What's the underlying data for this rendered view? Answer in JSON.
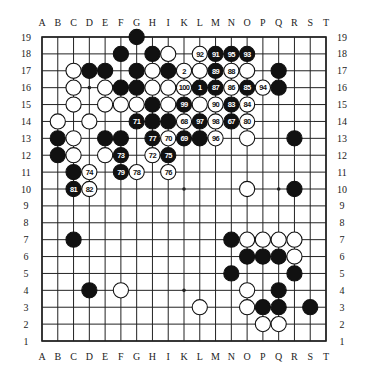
{
  "diagram": {
    "type": "go-board",
    "size": 19,
    "column_labels": [
      "A",
      "B",
      "C",
      "D",
      "E",
      "F",
      "G",
      "H",
      "J",
      "K",
      "L",
      "M",
      "N",
      "O",
      "P",
      "Q",
      "R",
      "S",
      "T"
    ],
    "column_labels_display": [
      "A",
      "B",
      "C",
      "D",
      "E",
      "F",
      "G",
      "H",
      "I",
      "K",
      "L",
      "M",
      "N",
      "O",
      "P",
      "Q",
      "R",
      "S",
      "T"
    ],
    "row_labels": [
      "19",
      "18",
      "17",
      "16",
      "15",
      "14",
      "13",
      "12",
      "11",
      "10",
      "9",
      "8",
      "7",
      "6",
      "5",
      "4",
      "3",
      "2",
      "1"
    ],
    "star_points": [
      "D16",
      "K10",
      "D4",
      "K4",
      "Q4",
      "D10",
      "Q10",
      "K16",
      "Q16"
    ],
    "colors": {
      "black": "#111111",
      "white": "#ffffff",
      "line": "#222222",
      "background": "#ffffff"
    },
    "stones": [
      {
        "pos": "G19",
        "color": "black",
        "label": ""
      },
      {
        "pos": "F18",
        "color": "black",
        "label": ""
      },
      {
        "pos": "H18",
        "color": "black",
        "label": ""
      },
      {
        "pos": "J18",
        "color": "white",
        "label": ""
      },
      {
        "pos": "L18",
        "color": "white",
        "label": "92"
      },
      {
        "pos": "M18",
        "color": "black",
        "label": "91"
      },
      {
        "pos": "N18",
        "color": "black",
        "label": "95"
      },
      {
        "pos": "O18",
        "color": "black",
        "label": "93"
      },
      {
        "pos": "C17",
        "color": "white",
        "label": ""
      },
      {
        "pos": "D17",
        "color": "black",
        "label": ""
      },
      {
        "pos": "E17",
        "color": "black",
        "label": ""
      },
      {
        "pos": "G17",
        "color": "black",
        "label": ""
      },
      {
        "pos": "H17",
        "color": "white",
        "label": ""
      },
      {
        "pos": "J17",
        "color": "black",
        "label": ""
      },
      {
        "pos": "K17",
        "color": "white",
        "label": "2"
      },
      {
        "pos": "L17",
        "color": "white",
        "label": ""
      },
      {
        "pos": "M17",
        "color": "black",
        "label": "89"
      },
      {
        "pos": "N17",
        "color": "white",
        "label": "88"
      },
      {
        "pos": "O17",
        "color": "white",
        "label": ""
      },
      {
        "pos": "Q17",
        "color": "black",
        "label": ""
      },
      {
        "pos": "C16",
        "color": "white",
        "label": ""
      },
      {
        "pos": "E16",
        "color": "white",
        "label": ""
      },
      {
        "pos": "F16",
        "color": "black",
        "label": ""
      },
      {
        "pos": "G16",
        "color": "black",
        "label": ""
      },
      {
        "pos": "H16",
        "color": "white",
        "label": ""
      },
      {
        "pos": "J16",
        "color": "white",
        "label": ""
      },
      {
        "pos": "K16",
        "color": "white",
        "label": "100"
      },
      {
        "pos": "L16",
        "color": "black",
        "label": "1"
      },
      {
        "pos": "M16",
        "color": "black",
        "label": "87"
      },
      {
        "pos": "N16",
        "color": "white",
        "label": "86"
      },
      {
        "pos": "O16",
        "color": "black",
        "label": "85"
      },
      {
        "pos": "P16",
        "color": "white",
        "label": "94"
      },
      {
        "pos": "Q16",
        "color": "black",
        "label": ""
      },
      {
        "pos": "C15",
        "color": "white",
        "label": ""
      },
      {
        "pos": "E15",
        "color": "white",
        "label": ""
      },
      {
        "pos": "F15",
        "color": "white",
        "label": ""
      },
      {
        "pos": "G15",
        "color": "white",
        "label": ""
      },
      {
        "pos": "H15",
        "color": "black",
        "label": ""
      },
      {
        "pos": "J15",
        "color": "white",
        "label": ""
      },
      {
        "pos": "K15",
        "color": "black",
        "label": "99"
      },
      {
        "pos": "L15",
        "color": "white",
        "label": ""
      },
      {
        "pos": "M15",
        "color": "white",
        "label": "90"
      },
      {
        "pos": "N15",
        "color": "black",
        "label": "83"
      },
      {
        "pos": "O15",
        "color": "white",
        "label": "84"
      },
      {
        "pos": "B14",
        "color": "white",
        "label": ""
      },
      {
        "pos": "D14",
        "color": "white",
        "label": ""
      },
      {
        "pos": "G14",
        "color": "black",
        "label": "71"
      },
      {
        "pos": "H14",
        "color": "black",
        "label": ""
      },
      {
        "pos": "J14",
        "color": "black",
        "label": ""
      },
      {
        "pos": "K14",
        "color": "white",
        "label": "68"
      },
      {
        "pos": "L14",
        "color": "black",
        "label": "97"
      },
      {
        "pos": "M14",
        "color": "white",
        "label": "98"
      },
      {
        "pos": "N14",
        "color": "black",
        "label": "67"
      },
      {
        "pos": "O14",
        "color": "white",
        "label": "80"
      },
      {
        "pos": "B13",
        "color": "black",
        "label": ""
      },
      {
        "pos": "C13",
        "color": "white",
        "label": ""
      },
      {
        "pos": "E13",
        "color": "black",
        "label": ""
      },
      {
        "pos": "F13",
        "color": "black",
        "label": ""
      },
      {
        "pos": "H13",
        "color": "black",
        "label": "77"
      },
      {
        "pos": "J13",
        "color": "white",
        "label": "70"
      },
      {
        "pos": "K13",
        "color": "black",
        "label": "69"
      },
      {
        "pos": "L13",
        "color": "black",
        "label": ""
      },
      {
        "pos": "M13",
        "color": "white",
        "label": "96"
      },
      {
        "pos": "O13",
        "color": "white",
        "label": ""
      },
      {
        "pos": "R13",
        "color": "black",
        "label": ""
      },
      {
        "pos": "B12",
        "color": "black",
        "label": ""
      },
      {
        "pos": "C12",
        "color": "white",
        "label": ""
      },
      {
        "pos": "E12",
        "color": "white",
        "label": ""
      },
      {
        "pos": "F12",
        "color": "black",
        "label": "73"
      },
      {
        "pos": "H12",
        "color": "white",
        "label": "72"
      },
      {
        "pos": "J12",
        "color": "black",
        "label": "75"
      },
      {
        "pos": "C11",
        "color": "black",
        "label": ""
      },
      {
        "pos": "D11",
        "color": "white",
        "label": "74"
      },
      {
        "pos": "F11",
        "color": "black",
        "label": "79"
      },
      {
        "pos": "G11",
        "color": "white",
        "label": "78"
      },
      {
        "pos": "J11",
        "color": "white",
        "label": "76"
      },
      {
        "pos": "C10",
        "color": "black",
        "label": "81"
      },
      {
        "pos": "D10",
        "color": "white",
        "label": "82"
      },
      {
        "pos": "O10",
        "color": "white",
        "label": ""
      },
      {
        "pos": "R10",
        "color": "black",
        "label": ""
      },
      {
        "pos": "C7",
        "color": "black",
        "label": ""
      },
      {
        "pos": "N7",
        "color": "black",
        "label": ""
      },
      {
        "pos": "O7",
        "color": "white",
        "label": ""
      },
      {
        "pos": "P7",
        "color": "white",
        "label": ""
      },
      {
        "pos": "Q7",
        "color": "white",
        "label": ""
      },
      {
        "pos": "R7",
        "color": "white",
        "label": ""
      },
      {
        "pos": "O6",
        "color": "black",
        "label": ""
      },
      {
        "pos": "P6",
        "color": "black",
        "label": ""
      },
      {
        "pos": "Q6",
        "color": "black",
        "label": ""
      },
      {
        "pos": "R6",
        "color": "white",
        "label": ""
      },
      {
        "pos": "N5",
        "color": "black",
        "label": ""
      },
      {
        "pos": "R5",
        "color": "black",
        "label": ""
      },
      {
        "pos": "D4",
        "color": "black",
        "label": ""
      },
      {
        "pos": "F4",
        "color": "white",
        "label": ""
      },
      {
        "pos": "O4",
        "color": "white",
        "label": ""
      },
      {
        "pos": "Q4",
        "color": "black",
        "label": ""
      },
      {
        "pos": "L3",
        "color": "white",
        "label": ""
      },
      {
        "pos": "O3",
        "color": "white",
        "label": ""
      },
      {
        "pos": "P3",
        "color": "black",
        "label": ""
      },
      {
        "pos": "Q3",
        "color": "black",
        "label": ""
      },
      {
        "pos": "S3",
        "color": "black",
        "label": ""
      },
      {
        "pos": "P2",
        "color": "white",
        "label": ""
      },
      {
        "pos": "Q2",
        "color": "white",
        "label": ""
      }
    ]
  }
}
